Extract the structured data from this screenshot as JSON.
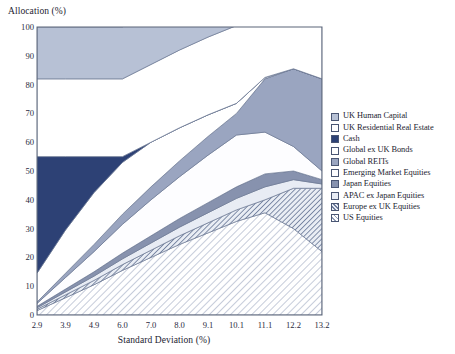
{
  "chart_data": {
    "type": "area",
    "title": "",
    "ylabel": "Allocation (%)",
    "xlabel": "Standard Deviation (%)",
    "ylim": [
      0,
      100
    ],
    "yticks": [
      0,
      10,
      20,
      30,
      40,
      50,
      60,
      70,
      80,
      90,
      100
    ],
    "ytick_labels": [
      "0",
      "10",
      "20",
      "30",
      "40",
      "50",
      "60",
      "70",
      "80",
      "90",
      "100"
    ],
    "x": [
      2.9,
      3.9,
      4.9,
      6.0,
      7.0,
      8.0,
      9.1,
      10.1,
      11.1,
      12.2,
      13.2
    ],
    "xtick_labels": [
      "2.9",
      "3.9",
      "4.9",
      "6.0",
      "7.0",
      "8.0",
      "9.1",
      "10.1",
      "11.1",
      "12.2",
      "13.2"
    ],
    "grid": false,
    "stacked": true,
    "legend_position": "right",
    "series": [
      {
        "name": "US Equities",
        "color": "#ffffff",
        "pattern": "diagonal-hatch-light",
        "values": [
          1.5,
          6.0,
          10.5,
          15.5,
          20.0,
          24.5,
          28.5,
          32.5,
          35.5,
          30.0,
          22.0
        ]
      },
      {
        "name": "Europe ex UK Equities",
        "color": "#97a3bd",
        "pattern": "diagonal-hatch-dark",
        "values": [
          0.5,
          1.0,
          1.5,
          2.0,
          2.5,
          3.0,
          3.5,
          4.0,
          4.5,
          14.0,
          22.0
        ]
      },
      {
        "name": "APAC ex Japan Equities",
        "color": "#e8ecf4",
        "pattern": "solid",
        "values": [
          0.5,
          1.0,
          1.5,
          2.0,
          2.5,
          3.0,
          3.5,
          4.0,
          4.5,
          3.0,
          1.5
        ]
      },
      {
        "name": "Japan Equities",
        "color": "#8792ae",
        "pattern": "solid",
        "values": [
          0.5,
          1.0,
          1.5,
          2.0,
          2.5,
          3.0,
          3.5,
          4.0,
          4.5,
          3.0,
          1.5
        ]
      },
      {
        "name": "Emerging Market Equities",
        "color": "#fdfdff",
        "pattern": "solid",
        "values": [
          1.0,
          4.0,
          7.0,
          10.0,
          12.5,
          14.5,
          16.5,
          18.0,
          14.5,
          8.5,
          3.0
        ]
      },
      {
        "name": "Global REITs",
        "color": "#9aa5c0",
        "pattern": "solid",
        "values": [
          0.5,
          1.5,
          2.5,
          3.5,
          4.5,
          5.5,
          6.5,
          7.5,
          18.5,
          27.0,
          32.0
        ]
      },
      {
        "name": "Global ex UK Bonds",
        "color": "#ffffff",
        "pattern": "solid",
        "values": [
          10.0,
          15.0,
          18.0,
          18.0,
          15.5,
          11.5,
          7.5,
          3.5,
          0.5,
          0.0,
          0.0
        ]
      },
      {
        "name": "Cash",
        "color": "#2d4175",
        "pattern": "solid",
        "values": [
          40.5,
          25.5,
          12.5,
          2.0,
          0.0,
          0.0,
          0.0,
          0.0,
          0.0,
          0.0,
          0.0
        ]
      },
      {
        "name": "UK Residential Real Estate",
        "color": "#ffffff",
        "pattern": "solid",
        "values": [
          27.0,
          27.0,
          27.0,
          27.0,
          27.0,
          27.0,
          27.0,
          27.0,
          27.0,
          27.0,
          27.0
        ]
      },
      {
        "name": "UK Human Capital",
        "color": "#b7c1d5",
        "pattern": "solid",
        "values": [
          18.0,
          18.0,
          18.0,
          18.0,
          18.0,
          18.0,
          18.0,
          18.0,
          18.0,
          18.0,
          18.0
        ]
      }
    ]
  },
  "legend": {
    "items": [
      {
        "label": "UK Human Capital",
        "swatch": "#b7c1d5",
        "pattern": "solid"
      },
      {
        "label": "UK Residential Real Estate",
        "swatch": "#ffffff",
        "pattern": "solid"
      },
      {
        "label": "Cash",
        "swatch": "#2d4175",
        "pattern": "solid"
      },
      {
        "label": "Global ex UK Bonds",
        "swatch": "#ffffff",
        "pattern": "solid"
      },
      {
        "label": "Global REITs",
        "swatch": "#9aa5c0",
        "pattern": "solid"
      },
      {
        "label": "Emerging Market Equities",
        "swatch": "#fdfdff",
        "pattern": "solid"
      },
      {
        "label": "Japan Equities",
        "swatch": "#8792ae",
        "pattern": "solid"
      },
      {
        "label": "APAC ex Japan Equities",
        "swatch": "#e8ecf4",
        "pattern": "solid"
      },
      {
        "label": "Europe ex UK Equities",
        "swatch": "#97a3bd",
        "pattern": "diagonal-hatch-dark"
      },
      {
        "label": "US Equities",
        "swatch": "#ffffff",
        "pattern": "diagonal-hatch-light"
      }
    ]
  },
  "colors": {
    "frame": "#5a6478",
    "text": "#1c1c30",
    "plot_background": "#ffffff"
  }
}
